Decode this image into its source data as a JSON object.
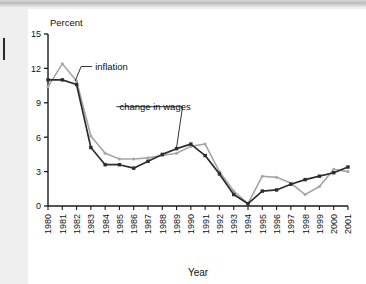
{
  "page": {
    "background_color": "#efefef",
    "panel_color": "#ffffff",
    "topbar_color": "#c4c4c4"
  },
  "chart_data": {
    "type": "line",
    "title": "",
    "xlabel": "Year",
    "ylabel": "Percent",
    "ylim": [
      0,
      15
    ],
    "yticks": [
      0,
      3,
      6,
      9,
      12,
      15
    ],
    "ytick_labels": [
      "0",
      "3",
      "6",
      "9",
      "12",
      "15"
    ],
    "grid": false,
    "legend_position": "inline-annotations",
    "x": [
      1980,
      1981,
      1982,
      1983,
      1984,
      1985,
      1986,
      1987,
      1988,
      1989,
      1990,
      1991,
      1992,
      1993,
      1994,
      1995,
      1996,
      1997,
      1998,
      1999,
      2000,
      2001
    ],
    "xtick_labels": [
      "1980",
      "1981",
      "1982",
      "1983",
      "1984",
      "1985",
      "1986",
      "1987",
      "1988",
      "1989",
      "1990",
      "1991",
      "1992",
      "1993",
      "1994",
      "1995",
      "1996",
      "1997",
      "1998",
      "1999",
      "2000",
      "2001"
    ],
    "series": [
      {
        "name": "inflation",
        "color": "#a6a6a6",
        "marker": "dot",
        "values": [
          10.4,
          12.4,
          10.9,
          6.1,
          4.6,
          4.1,
          4.1,
          4.2,
          4.4,
          4.6,
          5.2,
          5.4,
          3.0,
          1.3,
          0.2,
          2.6,
          2.5,
          2.0,
          1.0,
          1.7,
          3.2,
          3.0
        ]
      },
      {
        "name": "change in wages",
        "color": "#2d2d2d",
        "marker": "square",
        "values": [
          11.0,
          11.0,
          10.6,
          5.1,
          3.6,
          3.6,
          3.3,
          3.9,
          4.5,
          5.0,
          5.4,
          4.4,
          2.8,
          1.0,
          0.2,
          1.3,
          1.4,
          1.9,
          2.3,
          2.6,
          2.9,
          3.4
        ]
      }
    ],
    "annotations": [
      {
        "id": "inflation-annotation",
        "text": "inflation",
        "text_x": 1983.3,
        "text_y": 11.9,
        "leader_to_x": 1981.9,
        "leader_to_y": 10.9
      },
      {
        "id": "wages-annotation",
        "text": "change in wages",
        "text_x": 1985.0,
        "text_y": 8.4,
        "leader_to_x": 1989.0,
        "leader_to_y": 5.1
      }
    ]
  }
}
